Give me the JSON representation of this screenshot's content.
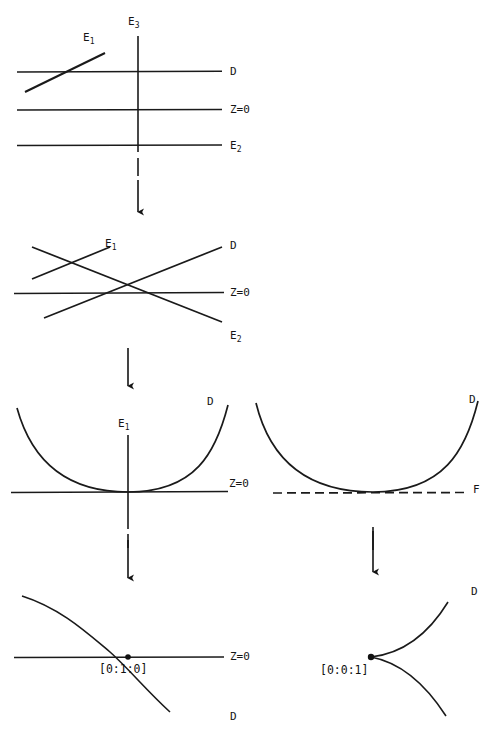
{
  "document": {
    "kind": "mathematical-figure",
    "description": "Sequence of degeneration diagrams of divisors and exceptional curves"
  },
  "panels": [
    {
      "id": "panel-1",
      "labels": {
        "e3": "E",
        "e3_sub": "3",
        "e1": "E",
        "e1_sub": "1",
        "d": "D",
        "z0": "Z=0",
        "e2": "E",
        "e2_sub": "2"
      }
    },
    {
      "id": "panel-2",
      "labels": {
        "e1": "E",
        "e1_sub": "1",
        "d": "D",
        "z0": "Z=0",
        "e2": "E",
        "e2_sub": "2"
      }
    },
    {
      "id": "panel-3-left",
      "labels": {
        "e1": "E",
        "e1_sub": "1",
        "d": "D",
        "z0": "Z=0"
      }
    },
    {
      "id": "panel-3-right",
      "labels": {
        "d": "D",
        "f": "F"
      }
    },
    {
      "id": "panel-4-left",
      "labels": {
        "z0": "Z=0",
        "d": "D",
        "point": "[0:1:0]"
      }
    },
    {
      "id": "panel-4-right",
      "labels": {
        "d": "D",
        "point": "[0:0:1]"
      }
    }
  ],
  "colors": {
    "ink": "#151515",
    "paper": "#ffffff",
    "line": "#1a1a1a"
  }
}
